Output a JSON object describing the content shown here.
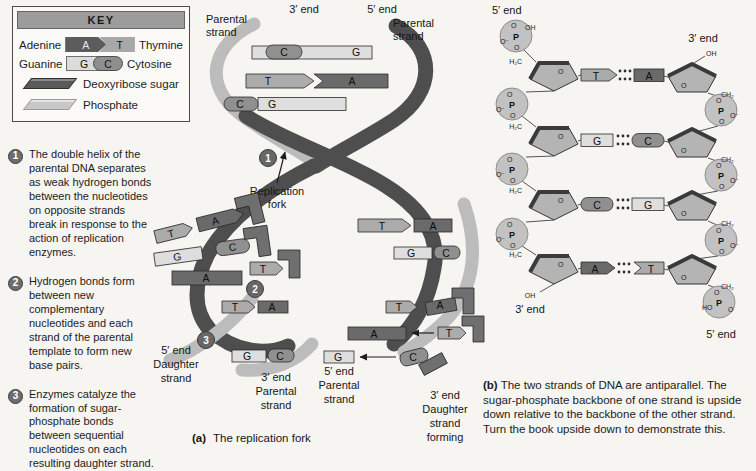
{
  "colors": {
    "adenine": "#6a6a6a",
    "thymine": "#ababab",
    "guanine": "#dedede",
    "cytosine": "#909090",
    "sugar": "#5a5a5a",
    "phosphate": "#c8c8c8",
    "ribbon_dark": "#4e4e4e",
    "ribbon_light": "#bcbcbc",
    "badge": "#6d6d6d",
    "background": "#f6f5f1"
  },
  "key": {
    "title": "KEY",
    "pairs": [
      {
        "left_label": "Adenine",
        "left_letter": "A",
        "right_letter": "T",
        "right_label": "Thymine"
      },
      {
        "left_label": "Guanine",
        "left_letter": "G",
        "right_letter": "C",
        "right_label": "Cytosine"
      }
    ],
    "sugar_label": "Deoxyribose sugar",
    "phosphate_label": "Phosphate"
  },
  "steps": [
    {
      "num": "1",
      "text": "The double helix of the parental DNA separates as weak hydrogen bonds between the nucleotides on opposite strands break in response to the action of replication enzymes."
    },
    {
      "num": "2",
      "text": "Hydrogen bonds form between new complementary nucleotides and each strand of the parental template to form new base pairs."
    },
    {
      "num": "3",
      "text": "Enzymes catalyze the formation of sugar-phosphate bonds between sequential nucleotides on each resulting daughter strand."
    }
  ],
  "panel_a": {
    "labels": {
      "parental_left": [
        "Parental",
        "strand"
      ],
      "end_3_top": "3′ end",
      "end_5_top": "5′ end",
      "parental_right": [
        "Parental",
        "strand"
      ],
      "replication_fork": [
        "Replication",
        "fork"
      ],
      "daughter_left": [
        "5′ end",
        "Daughter",
        "strand"
      ],
      "parental_bottom_left": [
        "3′ end",
        "Parental",
        "strand"
      ],
      "parental_bottom_right": [
        "5′ end",
        "Parental",
        "strand"
      ],
      "daughter_right": [
        "3′ end",
        "Daughter",
        "strand",
        "forming"
      ]
    },
    "markers": {
      "m1": "1",
      "m2": "2",
      "m3": "3"
    },
    "top_rungs": [
      {
        "l": "C",
        "r": "G"
      },
      {
        "l": "T",
        "r": "A"
      },
      {
        "l": "C",
        "r": "G"
      }
    ],
    "left_branch": {
      "template_bases": [
        "T",
        "G",
        "A"
      ],
      "incoming": [
        "A",
        "C",
        "T"
      ],
      "new_rungs": [
        {
          "l": "T",
          "r": "A"
        },
        {
          "l": "G",
          "r": "C"
        }
      ]
    },
    "right_branch": {
      "new_rungs": [
        {
          "l": "T",
          "r": "A"
        },
        {
          "l": "G",
          "r": "C"
        }
      ],
      "template_bases": [
        "T",
        "A",
        "G"
      ],
      "incoming": [
        "A",
        "T",
        "C"
      ]
    },
    "caption": {
      "prefix": "(a)",
      "text": "The replication fork"
    }
  },
  "panel_b": {
    "ends": {
      "top_left": "5′ end",
      "top_right": "3′ end",
      "bottom_left": "3′ end",
      "bottom_right": "5′ end"
    },
    "rungs": [
      {
        "left": "T",
        "right": "A"
      },
      {
        "left": "G",
        "right": "C"
      },
      {
        "left": "C",
        "right": "G"
      },
      {
        "left": "A",
        "right": "T"
      }
    ],
    "chem": {
      "p": "P",
      "o": "O",
      "o_minus": "O⁻",
      "oh": "OH",
      "ho": "HO",
      "h2c": "H₂C",
      "ch2": "CH₂"
    },
    "caption": {
      "prefix": "(b)",
      "text": "The two strands of DNA are antiparallel. The sugar-phosphate backbone of one strand is upside down relative to the backbone of the other strand. Turn the book upside down to demonstrate this."
    }
  }
}
